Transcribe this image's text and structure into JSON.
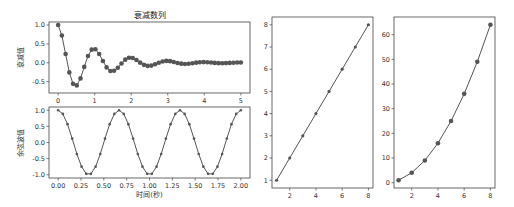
{
  "chart_data": [
    {
      "id": "damped",
      "type": "line",
      "title": "衰减数列",
      "xlabel": "",
      "ylabel": "衰减值",
      "xlim": [
        -0.25,
        5.25
      ],
      "ylim": [
        -0.8,
        1.08
      ],
      "xticks": [
        0,
        1,
        2,
        3,
        4,
        5
      ],
      "yticks": [
        -0.5,
        0.0,
        0.5,
        1.0
      ],
      "ytick_labels": [
        "-0.5",
        "0.0",
        "0.5",
        "1.0"
      ],
      "marker": "circle",
      "func": "exp(-t)*cos(2*pi*t)",
      "x_range": [
        0,
        5
      ],
      "n_points": 50,
      "grid": false,
      "box": {
        "left": 49,
        "top": 22,
        "right": 250,
        "bottom": 93
      }
    },
    {
      "id": "cosine",
      "type": "line",
      "title": "",
      "xlabel": "时间(秒)",
      "ylabel": "余弦波值",
      "xlim": [
        -0.1,
        2.1
      ],
      "ylim": [
        -1.1,
        1.1
      ],
      "xticks": [
        0.0,
        0.25,
        0.5,
        0.75,
        1.0,
        1.25,
        1.5,
        1.75,
        2.0
      ],
      "xtick_labels": [
        "0.00",
        "0.25",
        "0.50",
        "0.75",
        "1.00",
        "1.25",
        "1.50",
        "1.75",
        "2.00"
      ],
      "yticks": [
        -1.0,
        -0.5,
        0.0,
        0.5,
        1.0
      ],
      "ytick_labels": [
        "-1.0",
        "-0.5",
        "0.0",
        "0.5",
        "1.0"
      ],
      "marker": "dot",
      "func": "cos(3*pi*t)",
      "x_range": [
        0,
        2
      ],
      "n_points": 40,
      "grid": false,
      "box": {
        "left": 49,
        "top": 107,
        "right": 250,
        "bottom": 178
      }
    },
    {
      "id": "linear",
      "type": "line",
      "title": "",
      "xlabel": "",
      "ylabel": "",
      "x": [
        1,
        2,
        3,
        4,
        5,
        6,
        7,
        8
      ],
      "y": [
        1,
        2,
        3,
        4,
        5,
        6,
        7,
        8
      ],
      "xlim": [
        0.65,
        8.35
      ],
      "ylim": [
        0.65,
        8.35
      ],
      "xticks": [
        2,
        4,
        6,
        8
      ],
      "yticks": [
        1,
        2,
        3,
        4,
        5,
        6,
        7,
        8
      ],
      "marker": "star",
      "grid": false,
      "box": {
        "left": 272,
        "top": 17,
        "right": 373,
        "bottom": 188
      }
    },
    {
      "id": "square",
      "type": "line",
      "title": "",
      "xlabel": "",
      "ylabel": "",
      "x": [
        1,
        2,
        3,
        4,
        5,
        6,
        7,
        8
      ],
      "y": [
        1,
        4,
        9,
        16,
        25,
        36,
        49,
        64
      ],
      "xlim": [
        0.65,
        8.35
      ],
      "ylim": [
        -2.15,
        67.15
      ],
      "xticks": [
        2,
        4,
        6,
        8
      ],
      "yticks": [
        0,
        10,
        20,
        30,
        40,
        50,
        60
      ],
      "marker": "circle",
      "grid": false,
      "box": {
        "left": 394,
        "top": 17,
        "right": 495,
        "bottom": 188
      }
    }
  ],
  "colors": {
    "line": "#555555",
    "marker": "#555555",
    "axes": "#444444",
    "text": "#333333"
  }
}
